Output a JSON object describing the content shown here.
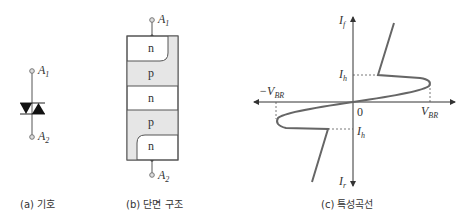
{
  "panels": {
    "a": {
      "caption": "(a) 기호",
      "terminal_top": "A",
      "terminal_top_sub": "1",
      "terminal_bottom": "A",
      "terminal_bottom_sub": "2"
    },
    "b": {
      "caption": "(b) 단면 구조",
      "terminal_top": "A",
      "terminal_top_sub": "1",
      "terminal_bottom": "A",
      "terminal_bottom_sub": "2",
      "layers": [
        "n",
        "p",
        "n",
        "p",
        "n"
      ]
    },
    "c": {
      "caption": "(c) 특성곡선",
      "y_axis_top": "I",
      "y_axis_top_sub": "f",
      "y_axis_bottom": "I",
      "y_axis_bottom_sub": "r",
      "origin": "0",
      "v_br": "V",
      "v_br_sub": "BR",
      "neg_v_br": "−V",
      "neg_v_br_sub": "BR",
      "ih_upper": "I",
      "ih_upper_sub": "h",
      "ih_lower": "I",
      "ih_lower_sub": "h"
    }
  },
  "colors": {
    "line": "#555555",
    "curve": "#666666",
    "p_layer_fill": "#e6e6e6",
    "terminal": "#888888"
  }
}
